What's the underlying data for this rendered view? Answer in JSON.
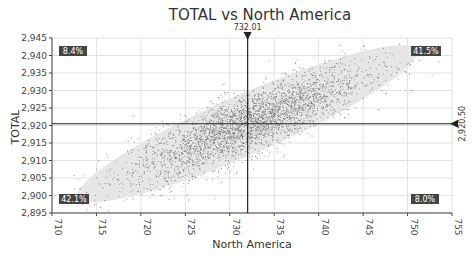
{
  "chart_data": {
    "type": "scatter",
    "title": "TOTAL vs North America",
    "xlabel": "North America",
    "ylabel": "TOTAL",
    "xlim": [
      710,
      755
    ],
    "ylim": [
      2895,
      2945
    ],
    "x_ticks": [
      710,
      715,
      720,
      725,
      730,
      735,
      740,
      745,
      750,
      755
    ],
    "x_tick_labels": [
      "710",
      "715",
      "720",
      "725",
      "730",
      "735",
      "740",
      "745",
      "750",
      "755"
    ],
    "y_ticks": [
      2895,
      2900,
      2905,
      2910,
      2915,
      2920,
      2925,
      2930,
      2935,
      2940,
      2945
    ],
    "y_tick_labels": [
      "2,895",
      "2,900",
      "2,905",
      "2,910",
      "2,915",
      "2,920",
      "2,925",
      "2,930",
      "2,935",
      "2,940",
      "2,945"
    ],
    "grid": true,
    "legend": "none",
    "crosshair": {
      "x": 732.01,
      "x_label": "732.01",
      "y": 2920.5,
      "y_label": "2,920.50"
    },
    "quadrant_percentages": {
      "top_left": "8.4%",
      "top_right": "41.5%",
      "bottom_left": "42.1%",
      "bottom_right": "8.0%"
    },
    "confidence_ellipse": {
      "center": [
        732.0,
        2920.5
      ],
      "x_extent": [
        713,
        752
      ],
      "y_extent": [
        2898,
        2942
      ]
    },
    "scatter_description": {
      "n_points_approx": 5000,
      "correlation_approx": 0.84,
      "mean_x": 732.0,
      "mean_y": 2920.5,
      "sd_x": 6.5,
      "sd_y": 8.0
    }
  },
  "colors": {
    "point": "#555555",
    "ellipse": "#e6e6e6",
    "grid": "#e2e2e2",
    "axis": "#444444",
    "crosshair": "#222222",
    "quad_bg": "#444444"
  }
}
